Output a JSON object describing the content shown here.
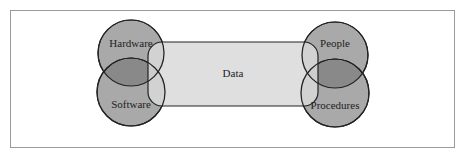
{
  "diagram": {
    "center_label": "Data",
    "nodes": [
      {
        "id": "hardware",
        "label": "Hardware"
      },
      {
        "id": "software",
        "label": "Software"
      },
      {
        "id": "people",
        "label": "People"
      },
      {
        "id": "procedures",
        "label": "Procedures"
      }
    ],
    "colors": {
      "circle_fill": "#a9a9a9",
      "box_fill": "#d9d9d9",
      "stroke": "#222222",
      "frame": "#9a9a9a"
    }
  }
}
